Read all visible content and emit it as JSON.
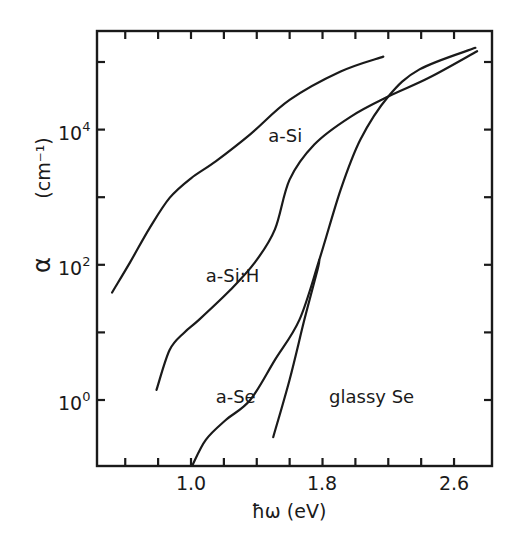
{
  "chart_data": {
    "type": "line",
    "title": "",
    "xlabel": "ħω (eV)",
    "ylabel": "α",
    "ylabel_unit": "(cm⁻¹)",
    "yscale": "log",
    "xlim": [
      0.42,
      2.8
    ],
    "ylim_log10": [
      -1.0,
      5.47
    ],
    "xticks_major": [
      1.0,
      1.8,
      2.6
    ],
    "xticks_minor_step": 0.2,
    "yticks_major": [
      {
        "exp": "0",
        "value": 1
      },
      {
        "exp": "2",
        "value": 100
      },
      {
        "exp": "4",
        "value": 10000
      }
    ],
    "yticks_minor_log10": [
      -1,
      1,
      3,
      5
    ],
    "grid": false,
    "series": [
      {
        "name": "a-Si",
        "label_pos": {
          "eV": 1.47,
          "log10": 3.82
        },
        "points": [
          [
            0.52,
            1.59
          ],
          [
            0.63,
            2.04
          ],
          [
            0.75,
            2.55
          ],
          [
            0.87,
            2.99
          ],
          [
            1.0,
            3.28
          ],
          [
            1.15,
            3.53
          ],
          [
            1.36,
            3.93
          ],
          [
            1.6,
            4.44
          ],
          [
            1.91,
            4.86
          ],
          [
            2.17,
            5.08
          ]
        ]
      },
      {
        "name": "a-Si:H",
        "label_pos": {
          "eV": 1.09,
          "log10": 1.75
        },
        "points": [
          [
            0.79,
            0.15
          ],
          [
            0.87,
            0.74
          ],
          [
            0.96,
            1.0
          ],
          [
            1.05,
            1.19
          ],
          [
            1.24,
            1.63
          ],
          [
            1.39,
            2.04
          ],
          [
            1.51,
            2.52
          ],
          [
            1.6,
            3.26
          ],
          [
            1.75,
            3.78
          ],
          [
            1.97,
            4.19
          ],
          [
            2.2,
            4.49
          ],
          [
            2.45,
            4.77
          ],
          [
            2.74,
            5.16
          ]
        ]
      },
      {
        "name": "a-Se",
        "label_pos": {
          "eV": 1.15,
          "log10": -0.05
        },
        "points": [
          [
            1.01,
            -0.96
          ],
          [
            1.09,
            -0.59
          ],
          [
            1.21,
            -0.3
          ],
          [
            1.36,
            0.0
          ],
          [
            1.51,
            0.59
          ],
          [
            1.66,
            1.19
          ],
          [
            1.78,
            2.07
          ],
          [
            1.91,
            3.11
          ],
          [
            2.03,
            3.85
          ],
          [
            2.2,
            4.49
          ],
          [
            2.39,
            4.89
          ],
          [
            2.73,
            5.21
          ]
        ]
      },
      {
        "name": "glassy Se",
        "label_pos": {
          "eV": 1.84,
          "log10": -0.05
        },
        "points": [
          [
            1.5,
            -0.55
          ],
          [
            1.6,
            0.3
          ],
          [
            1.69,
            1.19
          ],
          [
            1.77,
            1.93
          ],
          [
            1.78,
            2.07
          ]
        ]
      }
    ]
  },
  "axes": {
    "x_tick_labels": [
      "1.0",
      "1.8",
      "2.6"
    ],
    "y_tick_base": "10",
    "y_tick_exps": [
      "0",
      "2",
      "4"
    ]
  }
}
